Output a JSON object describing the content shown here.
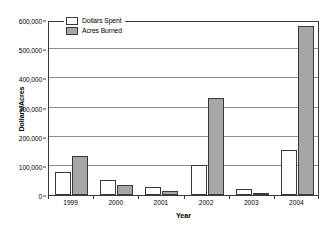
{
  "chart_data": {
    "type": "bar",
    "title": "",
    "xlabel": "Year",
    "ylabel": "Dollars/Acres",
    "categories": [
      "1999",
      "2000",
      "2001",
      "2002",
      "2003",
      "2004"
    ],
    "series": [
      {
        "name": "Dollars Spent",
        "color": "#ffffff",
        "values": [
          80000,
          52000,
          27000,
          104000,
          19000,
          155000
        ]
      },
      {
        "name": "Acres Burned",
        "color": "#a6a6a6",
        "values": [
          135000,
          34000,
          14000,
          333000,
          8000,
          578000
        ]
      }
    ],
    "ylim": [
      0,
      600000
    ],
    "ytick_values": [
      0,
      100000,
      200000,
      300000,
      400000,
      500000,
      600000
    ],
    "ytick_labels": [
      "0",
      "100,000",
      "200,000",
      "300,000",
      "400,000",
      "500,000",
      "600,000"
    ],
    "grid": true,
    "grid_axis": "y",
    "legend_position": "top-left-inside",
    "legend_entries": [
      "Dollars Spent",
      "Acres Burned"
    ],
    "frame_color": "#3a3a3a",
    "gridline_color": "#8d8d8d",
    "background": "#ffffff"
  }
}
